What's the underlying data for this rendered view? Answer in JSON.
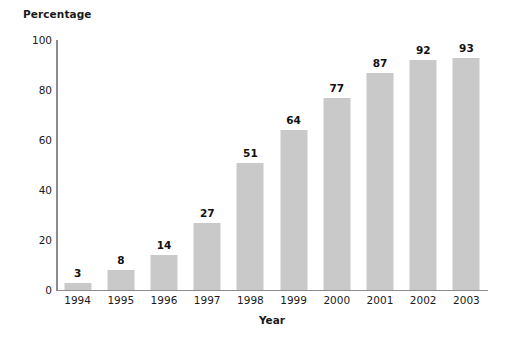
{
  "chart_data": {
    "type": "bar",
    "title": "",
    "subtitle": "",
    "ylabel": "Percentage",
    "xlabel": "Year",
    "categories": [
      "1994",
      "1995",
      "1996",
      "1997",
      "1998",
      "1999",
      "2000",
      "2001",
      "2002",
      "2003"
    ],
    "values": [
      3,
      8,
      14,
      27,
      51,
      64,
      77,
      87,
      92,
      93
    ],
    "data_labels": [
      "3",
      "8",
      "14",
      "27",
      "51",
      "64",
      "77",
      "87",
      "92",
      "93"
    ],
    "ylim": [
      0,
      100
    ],
    "yticks": [
      0,
      20,
      40,
      60,
      80,
      100
    ],
    "ytick_labels": [
      "0",
      "20",
      "40",
      "60",
      "80",
      "100"
    ],
    "grid": false,
    "legend": false,
    "legend_position": "none",
    "bar_color": "#c9c9c9",
    "axis_color": "#8c8c8c",
    "text_color": "#1a1a1a",
    "background_color": "#ffffff",
    "series": [
      {
        "name": "Percentage",
        "values": [
          3,
          8,
          14,
          27,
          51,
          64,
          77,
          87,
          92,
          93
        ]
      }
    ]
  }
}
